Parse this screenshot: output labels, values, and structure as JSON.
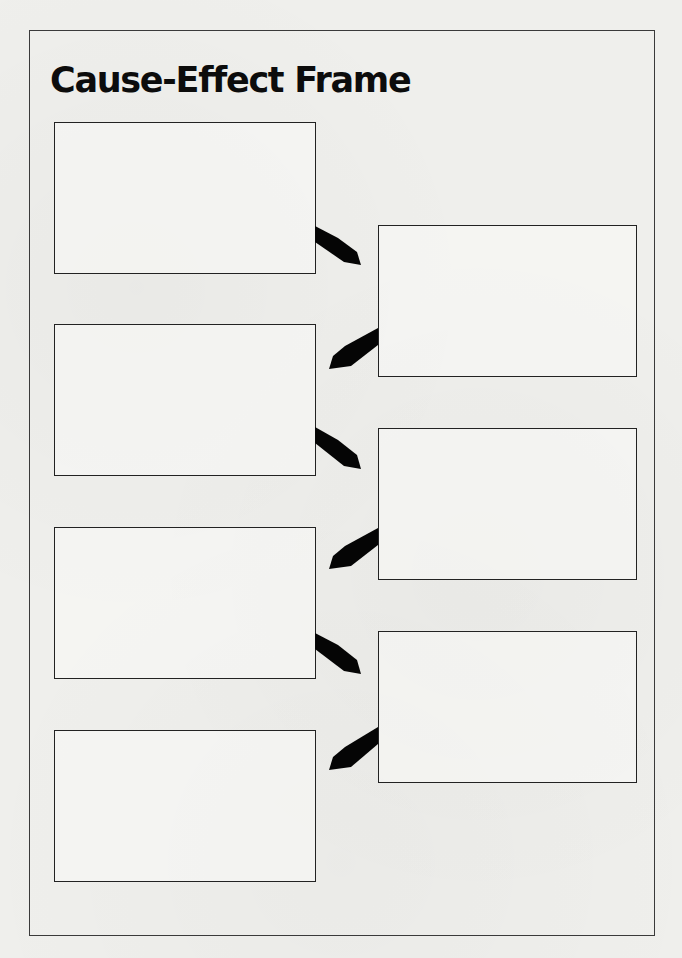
{
  "page": {
    "title": "Cause-Effect Frame"
  },
  "colors": {
    "ink": "#0c0c0c",
    "paper": "#efefec",
    "box_border": "#222222"
  },
  "frame": {
    "causes": [
      {
        "id": "left-1",
        "text": ""
      },
      {
        "id": "left-2",
        "text": ""
      },
      {
        "id": "left-3",
        "text": ""
      },
      {
        "id": "left-4",
        "text": ""
      }
    ],
    "effects": [
      {
        "id": "right-1",
        "text": ""
      },
      {
        "id": "right-2",
        "text": ""
      },
      {
        "id": "right-3",
        "text": ""
      }
    ],
    "arrows": [
      {
        "from": "left-1",
        "to": "right-1",
        "direction": "down-right"
      },
      {
        "from": "right-1",
        "to": "left-2",
        "direction": "down-left"
      },
      {
        "from": "left-2",
        "to": "right-2",
        "direction": "down-right"
      },
      {
        "from": "right-2",
        "to": "left-3",
        "direction": "down-left"
      },
      {
        "from": "left-3",
        "to": "right-3",
        "direction": "down-right"
      },
      {
        "from": "right-3",
        "to": "left-4",
        "direction": "down-left"
      }
    ]
  }
}
